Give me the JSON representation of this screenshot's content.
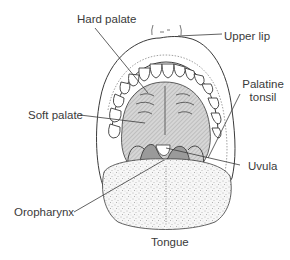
{
  "figure": {
    "type": "anatomical-illustration",
    "line_color": "#3a3a3a",
    "shade_color": "#bdbdbd",
    "dark_shade_color": "#8a8a8a"
  },
  "labels": {
    "hard_palate": "Hard palate",
    "upper_lip": "Upper lip",
    "palatine_tonsil_line1": "Palatine",
    "palatine_tonsil_line2": "tonsil",
    "soft_palate": "Soft palate",
    "uvula": "Uvula",
    "oropharynx": "Oropharynx",
    "tongue": "Tongue"
  }
}
